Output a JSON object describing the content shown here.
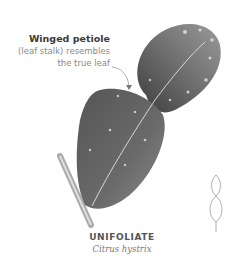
{
  "annotation": {
    "title": "Winged petiole",
    "line1": "(leaf stalk) resembles",
    "line2": "the true leaf"
  },
  "caption": {
    "name": "UNIFOLIATE",
    "scientific": "Citrus hystrix"
  },
  "icons": {
    "leaf_shape": "unifoliate-outline-icon",
    "arrow": "pointer-arrow-icon"
  },
  "colors": {
    "background": "#ffffff",
    "leaf_dark": "#4a4a4a",
    "leaf_mid": "#7a7a7a",
    "text_title": "#3a3a3a",
    "text_body": "#8a8a8a"
  }
}
